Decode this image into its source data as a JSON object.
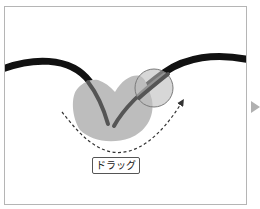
{
  "diagram": {
    "label": "ドラッグ",
    "colors": {
      "stroke": "#111111",
      "highlight": "#bdbdbd",
      "overlap": "#555555",
      "brush_circle": "#7a7a7a",
      "drag_path": "#333333",
      "next_arrow": "#b0b0b0",
      "border": "#b5b5b5"
    }
  }
}
